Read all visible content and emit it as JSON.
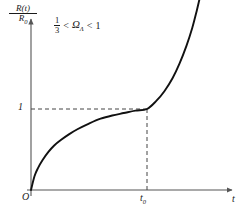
{
  "chart_data": {
    "type": "line",
    "title": "",
    "subtitle": "",
    "ylabel_numerator": "R(t)",
    "ylabel_denominator": "R",
    "ylabel_denominator_sub": "0",
    "xlabel": "t",
    "annotation": {
      "fraction_numerator": "1",
      "fraction_denominator": "3",
      "less_than_left": "<",
      "symbol": "Ω",
      "symbol_sub": "Λ",
      "less_than_right": "<",
      "upper_bound": "1",
      "full_text": "1/3 < ΩΛ < 1"
    },
    "origin_label": "O",
    "y_ticks": [
      {
        "label": "1",
        "value": 1
      }
    ],
    "x_ticks": [
      {
        "label": "t",
        "sub": "0",
        "value": 1
      }
    ],
    "grid": false,
    "legend": false,
    "xlim": [
      0,
      1.55
    ],
    "ylim": [
      0,
      2.6
    ],
    "dashed_guides": [
      {
        "name": "horizontal-guide-y1",
        "from": [
          0,
          1
        ],
        "to": [
          1,
          1
        ]
      },
      {
        "name": "vertical-guide-t0",
        "from": [
          1,
          0
        ],
        "to": [
          1,
          1
        ]
      }
    ],
    "curve": {
      "name": "scale-factor-curve",
      "color": "#111111",
      "description": "Scale factor R(t)/R0 rising steeply from origin, decelerating to an inflection near t0 where it equals 1, then accelerating upward",
      "points": [
        [
          0.0,
          0.0
        ],
        [
          0.03,
          0.17
        ],
        [
          0.06,
          0.27
        ],
        [
          0.1,
          0.37
        ],
        [
          0.15,
          0.47
        ],
        [
          0.2,
          0.55
        ],
        [
          0.26,
          0.62
        ],
        [
          0.33,
          0.69
        ],
        [
          0.4,
          0.75
        ],
        [
          0.5,
          0.82
        ],
        [
          0.6,
          0.88
        ],
        [
          0.7,
          0.92
        ],
        [
          0.8,
          0.95
        ],
        [
          0.9,
          0.98
        ],
        [
          1.0,
          1.0
        ],
        [
          1.08,
          1.1
        ],
        [
          1.15,
          1.22
        ],
        [
          1.22,
          1.38
        ],
        [
          1.28,
          1.56
        ],
        [
          1.34,
          1.78
        ],
        [
          1.39,
          2.0
        ],
        [
          1.43,
          2.22
        ],
        [
          1.46,
          2.4
        ],
        [
          1.49,
          2.56
        ]
      ]
    },
    "axis_color": "#555555",
    "background": "#ffffff"
  }
}
